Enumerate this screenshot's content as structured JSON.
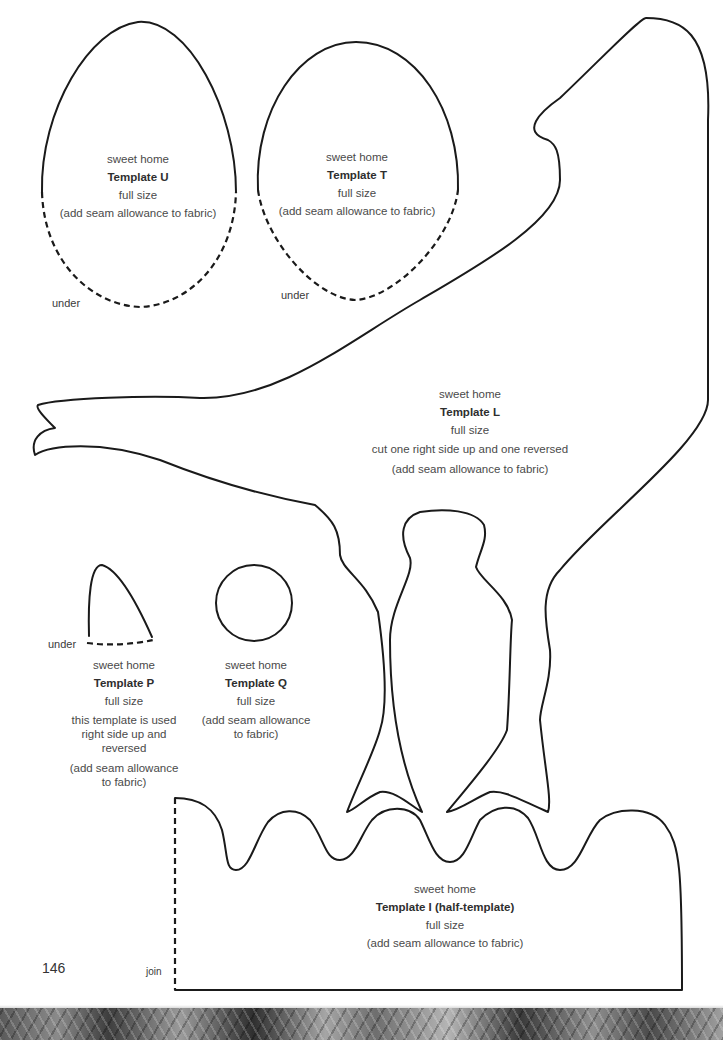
{
  "page": {
    "number": "146",
    "accent_colors": {
      "line": "#1a1a1a",
      "text": "#4a4a4a",
      "footer": "#6e6e6e"
    }
  },
  "templates": {
    "U": {
      "brand": "sweet home",
      "title": "Template U",
      "size": "full size",
      "notes": [
        "(add seam allowance to fabric)"
      ],
      "edge_label": "under"
    },
    "T": {
      "brand": "sweet home",
      "title": "Template T",
      "size": "full size",
      "notes": [
        "(add seam allowance to fabric)"
      ],
      "edge_label": "under"
    },
    "L": {
      "brand": "sweet home",
      "title": "Template L",
      "size": "full size",
      "notes": [
        "cut one right side up and one reversed",
        "(add seam allowance to fabric)"
      ]
    },
    "P": {
      "brand": "sweet home",
      "title": "Template P",
      "size": "full size",
      "notes": [
        "this template is used right side up and reversed",
        "(add seam allowance to fabric)"
      ],
      "edge_label": "under"
    },
    "Q": {
      "brand": "sweet home",
      "title": "Template Q",
      "size": "full size",
      "notes": [
        "(add seam allowance to fabric)"
      ]
    },
    "I": {
      "brand": "sweet home",
      "title": "Template I (half-template)",
      "size": "full size",
      "notes": [
        "(add seam allowance to fabric)"
      ],
      "edge_label": "join"
    }
  },
  "footer": {
    "decoration": "patterned-fabric-strip"
  }
}
